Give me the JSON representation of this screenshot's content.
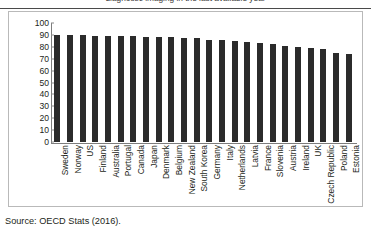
{
  "title": "diagnostic imaging in the last available year",
  "source_note": "Source: OECD Stats (2016).",
  "colors": {
    "bar": "#2b2b2b",
    "axis": "#7d7d7d",
    "frame": "#b9b9b9",
    "rule": "#4a4a4a",
    "text": "#231f20"
  },
  "chart_data": {
    "type": "bar",
    "title": "diagnostic imaging in the last available year",
    "xlabel": "",
    "ylabel": "",
    "ylim": [
      0,
      100
    ],
    "yticks": [
      0,
      10,
      20,
      30,
      40,
      50,
      60,
      70,
      80,
      90,
      100
    ],
    "grid": false,
    "legend": false,
    "categories": [
      "Sweden",
      "Norway",
      "US",
      "Finland",
      "Australia",
      "Portugal",
      "Canada",
      "Japan",
      "Denmark",
      "Belgium",
      "New Zealand",
      "South Korea",
      "Germany",
      "Italy",
      "Netherlands",
      "Latvia",
      "France",
      "Slovenia",
      "Austria",
      "Ireland",
      "UK",
      "Czech Republic",
      "Poland",
      "Estonia"
    ],
    "values": [
      90,
      90,
      90,
      89,
      89,
      89,
      89,
      88,
      88,
      88,
      87,
      87,
      86,
      86,
      85,
      84,
      83,
      82,
      81,
      80,
      79,
      78,
      75,
      74
    ]
  }
}
